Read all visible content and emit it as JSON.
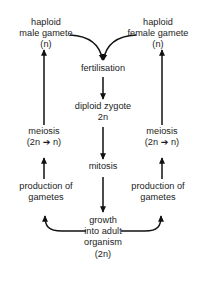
{
  "figure": {
    "kind": "life-cycle-flow-diagram",
    "background_color": "#ffffff",
    "text_color": "#1c1c1c",
    "line_color": "#111111",
    "cut_off_header_text": "— —— — —— —— — — —— — ——"
  },
  "nodes": {
    "male_gamete": {
      "line1": "haploid",
      "line2": "male gamete",
      "line3": "(n)"
    },
    "female_gamete": {
      "line1": "haploid",
      "line2": "female gamete",
      "line3": "(n)"
    },
    "fertilisation": {
      "line1": "fertilisation"
    },
    "zygote": {
      "line1": "diploid zygote",
      "line2": "2n"
    },
    "meiosis_left": {
      "line1": "meiosis",
      "line2": "(2n ➔ n)"
    },
    "meiosis_right": {
      "line1": "meiosis",
      "line2": "(2n ➔ n)"
    },
    "mitosis": {
      "line1": "mitosis"
    },
    "production_left": {
      "line1": "production of",
      "line2": "gametes"
    },
    "production_right": {
      "line1": "production of",
      "line2": "gametes"
    },
    "growth": {
      "line1": "growth",
      "line2": "into adult",
      "line3": "organism",
      "line4": "(2n)"
    }
  },
  "connectors": [
    {
      "name": "male-gamete-to-fertilisation",
      "type": "curve",
      "direction": "down-right"
    },
    {
      "name": "female-gamete-to-fertilisation",
      "type": "curve",
      "direction": "down-left"
    },
    {
      "name": "fertilisation-to-zygote",
      "type": "straight",
      "direction": "down"
    },
    {
      "name": "zygote-to-mitosis",
      "type": "straight",
      "direction": "down"
    },
    {
      "name": "mitosis-to-growth",
      "type": "straight",
      "direction": "down"
    },
    {
      "name": "growth-to-production-left",
      "type": "curve",
      "direction": "up-left"
    },
    {
      "name": "growth-to-production-right",
      "type": "curve",
      "direction": "up-right"
    },
    {
      "name": "production-left-to-meiosis-left",
      "type": "straight",
      "direction": "up"
    },
    {
      "name": "production-right-to-meiosis-right",
      "type": "straight",
      "direction": "up"
    },
    {
      "name": "meiosis-left-to-male-gamete",
      "type": "straight",
      "direction": "up"
    },
    {
      "name": "meiosis-right-to-female-gamete",
      "type": "straight",
      "direction": "up"
    }
  ]
}
